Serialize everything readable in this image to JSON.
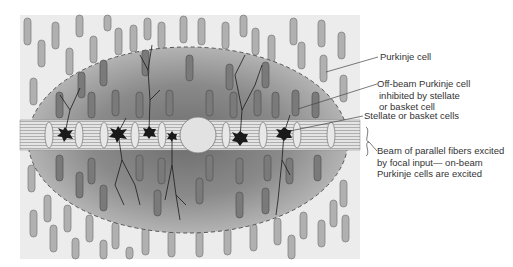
{
  "diagram": {
    "title": "",
    "labels": {
      "purkinje": "Purkinje cell",
      "off_beam_1": "Off-beam Purkinje cell",
      "off_beam_2": "inhibited by stellate",
      "off_beam_3": "or basket cell",
      "stellate": "Stellate or basket cells",
      "beam_1": "Beam of parallel fibers excited",
      "beam_2": "by focal input— on-beam",
      "beam_3": "Purkinje cells are excited"
    },
    "colors": {
      "background_panel": "#ececec",
      "inhibited_zone": "#8f8f8f",
      "cell_fill": "#a8a8a8",
      "cell_dark": "#777777",
      "beam": "#d6d6d6",
      "neuron": "#1a1a1a"
    }
  }
}
